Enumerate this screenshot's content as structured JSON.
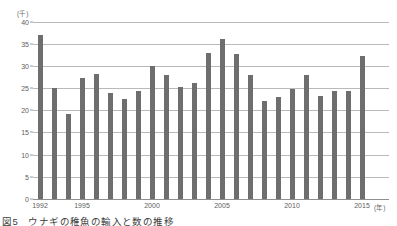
{
  "chart_data": {
    "type": "bar",
    "title": "",
    "caption": "図5　ウナギの稚魚の輸入と数の推移",
    "xlabel": "(年)",
    "ylabel": "(千)",
    "ylim": [
      0,
      40
    ],
    "ytick_values": [
      0,
      5,
      10,
      15,
      20,
      25,
      30,
      35,
      40
    ],
    "ytick_labels": [
      "0",
      "5",
      "10",
      "15",
      "20",
      "25",
      "30",
      "35",
      "40"
    ],
    "xtick_labels": [
      "1992",
      "1995",
      "2000",
      "2005",
      "2010",
      "2015"
    ],
    "grid": true,
    "legend": false,
    "bar_color": "#6e6e6e",
    "gridline_color": "#b9b9b9",
    "axis_color": "#8f8f8f",
    "categories": [
      "1992",
      "1993",
      "1994",
      "1995",
      "1996",
      "1997",
      "1998",
      "1999",
      "2000",
      "2001",
      "2002",
      "2003",
      "2004",
      "2005",
      "2006",
      "2007",
      "2008",
      "2009",
      "2010",
      "2011",
      "2012",
      "2013",
      "2014",
      "2015"
    ],
    "values": [
      37.0,
      25.0,
      19.2,
      27.3,
      28.2,
      24.0,
      22.5,
      24.4,
      30.0,
      27.9,
      25.2,
      26.1,
      32.8,
      36.0,
      32.6,
      28.0,
      22.1,
      23.0,
      24.9,
      28.0,
      23.3,
      24.3,
      24.3,
      32.3
    ]
  }
}
